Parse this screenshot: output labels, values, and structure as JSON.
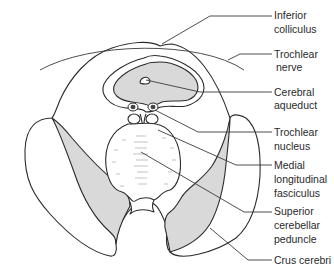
{
  "figure": {
    "colors": {
      "outline": "#2b2b2b",
      "shading": "#d9d9d9",
      "background": "#ffffff",
      "label_text": "#2a2a2a"
    },
    "labels": [
      {
        "id": "inferior-colliculus",
        "lines": [
          "Inferior",
          "colliculus"
        ]
      },
      {
        "id": "trochlear-nerve",
        "lines": [
          "Trochlear",
          "nerve"
        ]
      },
      {
        "id": "cerebral-aqueduct",
        "lines": [
          "Cerebral",
          "aqueduct"
        ]
      },
      {
        "id": "trochlear-nucleus",
        "lines": [
          "Trochlear",
          "nucleus"
        ]
      },
      {
        "id": "medial-longitudinal-fasciculus",
        "lines": [
          "Medial",
          "longitudinal",
          "fasciculus"
        ]
      },
      {
        "id": "superior-cerebellar-peduncle",
        "lines": [
          "Superior",
          "cerebellar",
          "peduncle"
        ]
      },
      {
        "id": "crus-cerebri",
        "lines": [
          "Crus cerebri"
        ]
      }
    ]
  }
}
